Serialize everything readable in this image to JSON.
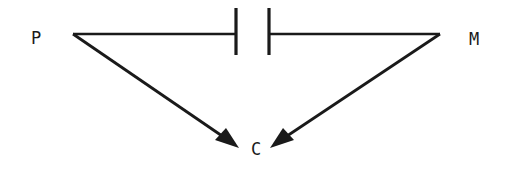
{
  "diagram": {
    "background_color": "#ffffff",
    "stroke_color": "#1a1a1a",
    "width": 510,
    "height": 174,
    "nodes": [
      {
        "id": "P",
        "label": "P",
        "x": 36,
        "y": 39
      },
      {
        "id": "M",
        "label": "M",
        "x": 474,
        "y": 40
      },
      {
        "id": "C",
        "label": "C",
        "x": 256,
        "y": 150
      }
    ],
    "edges": [
      {
        "id": "p-to-m",
        "from": "P",
        "to": "M",
        "kind": "blocked-path",
        "arrowhead": "none",
        "x1": 73,
        "y1": 34,
        "x2": 440,
        "y2": 34,
        "gap_start": 236,
        "gap_end": 269
      },
      {
        "id": "p-to-c",
        "from": "P",
        "to": "C",
        "kind": "directed",
        "arrowhead": "filled-triangle",
        "x1": 73,
        "y1": 34,
        "x2": 237,
        "y2": 146
      },
      {
        "id": "m-to-c",
        "from": "M",
        "to": "C",
        "kind": "directed",
        "arrowhead": "filled-triangle",
        "x1": 440,
        "y1": 34,
        "x2": 272,
        "y2": 146
      }
    ],
    "blockers": [
      {
        "id": "blocker-left",
        "x": 236,
        "y_top": 8,
        "y_bottom": 55
      },
      {
        "id": "blocker-right",
        "x": 269,
        "y_top": 8,
        "y_bottom": 55
      }
    ]
  }
}
